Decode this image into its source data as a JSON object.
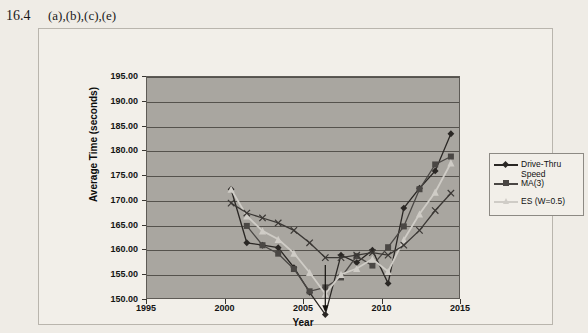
{
  "solution": {
    "number": "16.4",
    "parts": "(a),(b),(c),(e)"
  },
  "legend": {
    "items": [
      {
        "label": "Drive-Thru\nSpeed",
        "marker": "diamond",
        "color": "#2a2724",
        "name": "legend-item-drive-thru-speed"
      },
      {
        "label": "MA(3)",
        "marker": "square",
        "color": "#4a4744",
        "name": "legend-item-ma3"
      },
      {
        "label": "ES (W=0.5)",
        "marker": "triangle",
        "color": "#cfccc6",
        "name": "legend-item-es"
      }
    ]
  },
  "chart_data": {
    "type": "line",
    "title": "",
    "xlabel": "Year",
    "ylabel": "Average Time (seconds)",
    "xlim": [
      1995,
      2015
    ],
    "ylim": [
      150.0,
      195.0
    ],
    "xticks": [
      1995,
      2000,
      2005,
      2010,
      2015
    ],
    "yticks": [
      150.0,
      155.0,
      160.0,
      165.0,
      170.0,
      175.0,
      180.0,
      185.0,
      190.0,
      195.0
    ],
    "ytick_labels": [
      "150.00",
      "155.00",
      "160.00",
      "165.00",
      "170.00",
      "175.00",
      "180.00",
      "185.00",
      "190.00",
      "195.00"
    ],
    "xtick_labels": [
      "1995",
      "2000",
      "2005",
      "2010",
      "2015"
    ],
    "grid": true,
    "legend_position": "right",
    "plot_background": "#a9a6a0",
    "x": [
      1998,
      1999,
      2000,
      2001,
      2002,
      2003,
      2004,
      2005,
      2006,
      2007,
      2008,
      2009,
      2010,
      2011,
      2012
    ],
    "series": [
      {
        "name": "Drive-Thru Speed",
        "marker": "diamond",
        "color": "#2a2724",
        "values": [
          177.8,
          167.0,
          166.5,
          166.0,
          162.0,
          157.0,
          152.5,
          164.5,
          163.0,
          165.5,
          158.8,
          174.0,
          178.0,
          181.5,
          189.0
        ]
      },
      {
        "name": "MA(3)",
        "marker": "square",
        "color": "#4a4744",
        "values": [
          null,
          170.4,
          166.5,
          164.8,
          161.7,
          157.2,
          158.0,
          160.0,
          164.3,
          162.4,
          166.1,
          170.3,
          177.8,
          182.8,
          184.4
        ]
      },
      {
        "name": "ES (W=0.5)",
        "marker": "triangle",
        "color": "#cfccc6",
        "values": [
          177.8,
          172.4,
          169.4,
          167.7,
          164.9,
          161.0,
          156.7,
          160.6,
          161.8,
          163.7,
          161.2,
          167.6,
          172.8,
          177.2,
          183.1
        ]
      },
      {
        "name": "Linear Trend",
        "marker": "cross",
        "color": "#3b3835",
        "values": [
          175.0,
          173.0,
          172.0,
          171.0,
          169.5,
          167.0,
          164.0,
          164.0,
          164.5,
          165.0,
          164.5,
          166.5,
          169.5,
          173.5,
          177.0
        ]
      }
    ]
  }
}
